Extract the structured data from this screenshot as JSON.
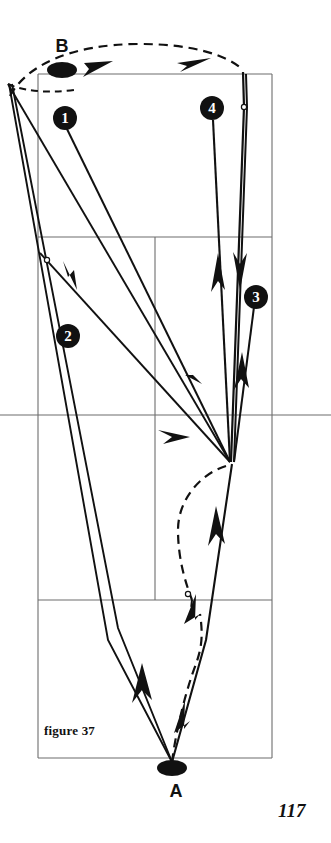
{
  "figure": {
    "caption": "figure 37",
    "page_number": "117",
    "colors": {
      "ink": "#111111",
      "court_line": "#6d6d6d",
      "background": "#ffffff"
    }
  },
  "court": {
    "name": "badminton-court-perspective",
    "outer": {
      "top_left_x": 38,
      "top_left_y": 74,
      "top_right_x": 272,
      "top_right_y": 74,
      "bottom_left_x": 38,
      "bottom_left_y": 758,
      "bottom_right_x": 272,
      "bottom_right_y": 758
    },
    "lines": [
      {
        "name": "net-line",
        "y": 74
      },
      {
        "name": "service-line-far",
        "y": 237
      },
      {
        "name": "center-line-horizontal",
        "y": 415
      },
      {
        "name": "service-line-near",
        "y": 600
      },
      {
        "name": "baseline-near",
        "y": 758
      },
      {
        "name": "sideline-left",
        "x": 38
      },
      {
        "name": "sideline-right",
        "x": 272
      },
      {
        "name": "center-service-line",
        "x": 155
      }
    ]
  },
  "players": [
    {
      "id": "A",
      "label": "A",
      "x": 172,
      "y": 768,
      "role": "near-player"
    },
    {
      "id": "B",
      "label": "B",
      "x": 62,
      "y": 70,
      "role": "far-player"
    }
  ],
  "shots": [
    {
      "number": "1",
      "badge_x": 65,
      "badge_y": 118,
      "description": "clear from A to B deep backhand corner"
    },
    {
      "number": "2",
      "badge_x": 68,
      "badge_y": 336,
      "description": "drop shot to forecourt"
    },
    {
      "number": "3",
      "badge_x": 256,
      "badge_y": 297,
      "description": "straight return along sideline"
    },
    {
      "number": "4",
      "badge_x": 212,
      "badge_y": 108,
      "description": "cross-court clear to rear court"
    }
  ],
  "markers": {
    "hollow_dots": [
      {
        "name": "shuttle-contact-point-far",
        "x": 244,
        "y": 107
      },
      {
        "name": "shuttle-contact-point-left",
        "x": 47,
        "y": 260
      },
      {
        "name": "shuttle-contact-point-near",
        "x": 188,
        "y": 594
      }
    ]
  },
  "legend": {
    "solid_line_meaning": "shuttle flight path",
    "dashed_line_meaning": "player movement path"
  }
}
